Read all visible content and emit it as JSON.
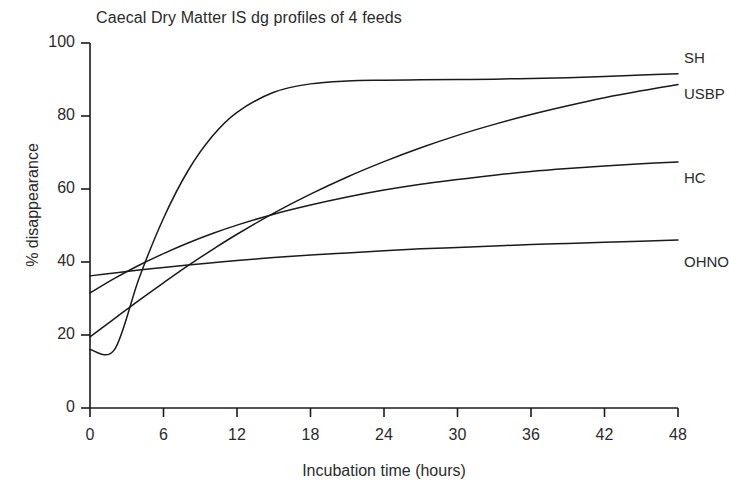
{
  "chart_data": {
    "type": "line",
    "title": "Caecal Dry Matter IS dg profiles of 4 feeds",
    "xlabel": "Incubation time (hours)",
    "ylabel": "% disappearance",
    "xlim": [
      0,
      48
    ],
    "ylim": [
      0,
      100
    ],
    "xticks": [
      "0",
      "6",
      "12",
      "18",
      "24",
      "30",
      "36",
      "42",
      "48"
    ],
    "yticks": [
      "0",
      "20",
      "40",
      "60",
      "80",
      "100"
    ],
    "grid": false,
    "legend_position": "right-inline-labels",
    "x": [
      0,
      2,
      4,
      6,
      8,
      10,
      12,
      15,
      18,
      21,
      24,
      27,
      30,
      33,
      36,
      39,
      42,
      45,
      48
    ],
    "series": [
      {
        "name": "SH",
        "label": "SH",
        "color": "#1a1a1a",
        "values": [
          16.0,
          16.0,
          35.5,
          52.0,
          65.0,
          74.5,
          81.0,
          86.5,
          88.8,
          89.6,
          89.8,
          89.9,
          90.0,
          90.1,
          90.3,
          90.5,
          90.8,
          91.2,
          91.6
        ]
      },
      {
        "name": "USBP",
        "label": "USBP",
        "color": "#1a1a1a",
        "values": [
          19.5,
          24.5,
          29.5,
          34.3,
          39.0,
          43.4,
          47.6,
          53.4,
          58.6,
          63.3,
          67.5,
          71.3,
          74.7,
          77.7,
          80.4,
          82.8,
          85.0,
          86.9,
          88.6
        ]
      },
      {
        "name": "HC",
        "label": "HC",
        "color": "#1a1a1a",
        "values": [
          31.5,
          35.5,
          39.1,
          42.3,
          45.2,
          47.8,
          50.1,
          53.1,
          55.6,
          57.8,
          59.7,
          61.3,
          62.6,
          63.8,
          64.8,
          65.6,
          66.3,
          66.9,
          67.4
        ]
      },
      {
        "name": "OHNO",
        "label": "OHNO",
        "color": "#1a1a1a",
        "values": [
          36.2,
          37.0,
          37.8,
          38.5,
          39.2,
          39.8,
          40.4,
          41.2,
          41.9,
          42.5,
          43.1,
          43.6,
          44.0,
          44.4,
          44.8,
          45.1,
          45.4,
          45.7,
          46.0
        ]
      }
    ]
  },
  "axes": {
    "y_tick_values": [
      0,
      20,
      40,
      60,
      80,
      100
    ],
    "x_tick_values": [
      0,
      6,
      12,
      18,
      24,
      30,
      36,
      42,
      48
    ]
  }
}
